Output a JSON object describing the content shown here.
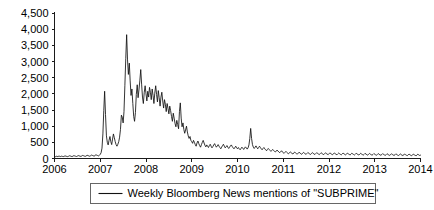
{
  "chart_data": {
    "type": "line",
    "title": "",
    "subtitle": "",
    "xlabel": "",
    "ylabel": "",
    "grid": false,
    "legend_position": "bottom-center",
    "xlim": [
      2006.0,
      2014.0
    ],
    "ylim": [
      0,
      4500
    ],
    "y_ticks": [
      0,
      500,
      1000,
      1500,
      2000,
      2500,
      3000,
      3500,
      4000,
      4500
    ],
    "y_tick_labels": [
      "0",
      "500",
      "1,000",
      "1,500",
      "2,000",
      "2,500",
      "3,000",
      "3,500",
      "4,000",
      "4,500"
    ],
    "x_ticks": [
      2006,
      2007,
      2008,
      2009,
      2010,
      2011,
      2012,
      2013,
      2014
    ],
    "x_tick_labels": [
      "2006",
      "2007",
      "2008",
      "2009",
      "2010",
      "2011",
      "2012",
      "2013",
      "2014"
    ],
    "series": [
      {
        "name": "Weekly Bloomberg News mentions of \"SUBPRIME\"",
        "color": "#111111",
        "x": [
          2006.0,
          2006.019,
          2006.038,
          2006.058,
          2006.077,
          2006.096,
          2006.115,
          2006.135,
          2006.154,
          2006.173,
          2006.192,
          2006.212,
          2006.231,
          2006.25,
          2006.269,
          2006.288,
          2006.308,
          2006.327,
          2006.346,
          2006.365,
          2006.385,
          2006.404,
          2006.423,
          2006.442,
          2006.462,
          2006.481,
          2006.5,
          2006.519,
          2006.538,
          2006.558,
          2006.577,
          2006.596,
          2006.615,
          2006.635,
          2006.654,
          2006.673,
          2006.692,
          2006.712,
          2006.731,
          2006.75,
          2006.769,
          2006.788,
          2006.808,
          2006.827,
          2006.846,
          2006.865,
          2006.885,
          2006.904,
          2006.923,
          2006.942,
          2006.962,
          2006.981,
          2007.0,
          2007.019,
          2007.038,
          2007.058,
          2007.077,
          2007.096,
          2007.115,
          2007.135,
          2007.154,
          2007.173,
          2007.192,
          2007.212,
          2007.231,
          2007.25,
          2007.269,
          2007.288,
          2007.308,
          2007.327,
          2007.346,
          2007.365,
          2007.385,
          2007.404,
          2007.423,
          2007.442,
          2007.462,
          2007.481,
          2007.5,
          2007.519,
          2007.538,
          2007.558,
          2007.577,
          2007.596,
          2007.615,
          2007.635,
          2007.654,
          2007.673,
          2007.692,
          2007.712,
          2007.731,
          2007.75,
          2007.769,
          2007.788,
          2007.808,
          2007.827,
          2007.846,
          2007.865,
          2007.885,
          2007.904,
          2007.923,
          2007.942,
          2007.962,
          2007.981,
          2008.0,
          2008.019,
          2008.038,
          2008.058,
          2008.077,
          2008.096,
          2008.115,
          2008.135,
          2008.154,
          2008.173,
          2008.192,
          2008.212,
          2008.231,
          2008.25,
          2008.269,
          2008.288,
          2008.308,
          2008.327,
          2008.346,
          2008.365,
          2008.385,
          2008.404,
          2008.423,
          2008.442,
          2008.462,
          2008.481,
          2008.5,
          2008.519,
          2008.538,
          2008.558,
          2008.577,
          2008.596,
          2008.615,
          2008.635,
          2008.654,
          2008.673,
          2008.692,
          2008.712,
          2008.731,
          2008.75,
          2008.769,
          2008.788,
          2008.808,
          2008.827,
          2008.846,
          2008.865,
          2008.885,
          2008.904,
          2008.923,
          2008.942,
          2008.962,
          2008.981,
          2009.0,
          2009.019,
          2009.038,
          2009.058,
          2009.077,
          2009.096,
          2009.115,
          2009.135,
          2009.154,
          2009.173,
          2009.192,
          2009.212,
          2009.231,
          2009.25,
          2009.269,
          2009.288,
          2009.308,
          2009.327,
          2009.346,
          2009.365,
          2009.385,
          2009.404,
          2009.423,
          2009.442,
          2009.462,
          2009.481,
          2009.5,
          2009.519,
          2009.538,
          2009.558,
          2009.577,
          2009.596,
          2009.615,
          2009.635,
          2009.654,
          2009.673,
          2009.692,
          2009.712,
          2009.731,
          2009.75,
          2009.769,
          2009.788,
          2009.808,
          2009.827,
          2009.846,
          2009.865,
          2009.885,
          2009.904,
          2009.923,
          2009.942,
          2009.962,
          2009.981,
          2010.0,
          2010.019,
          2010.038,
          2010.058,
          2010.077,
          2010.096,
          2010.115,
          2010.135,
          2010.154,
          2010.173,
          2010.192,
          2010.212,
          2010.231,
          2010.25,
          2010.269,
          2010.288,
          2010.308,
          2010.327,
          2010.346,
          2010.365,
          2010.385,
          2010.404,
          2010.423,
          2010.442,
          2010.462,
          2010.481,
          2010.5,
          2010.519,
          2010.538,
          2010.558,
          2010.577,
          2010.596,
          2010.615,
          2010.635,
          2010.654,
          2010.673,
          2010.692,
          2010.712,
          2010.731,
          2010.75,
          2010.769,
          2010.788,
          2010.808,
          2010.827,
          2010.846,
          2010.865,
          2010.885,
          2010.904,
          2010.923,
          2010.942,
          2010.962,
          2010.981,
          2011.0,
          2011.019,
          2011.038,
          2011.058,
          2011.077,
          2011.096,
          2011.115,
          2011.135,
          2011.154,
          2011.173,
          2011.192,
          2011.212,
          2011.231,
          2011.25,
          2011.269,
          2011.288,
          2011.308,
          2011.327,
          2011.346,
          2011.365,
          2011.385,
          2011.404,
          2011.423,
          2011.442,
          2011.462,
          2011.481,
          2011.5,
          2011.519,
          2011.538,
          2011.558,
          2011.577,
          2011.596,
          2011.615,
          2011.635,
          2011.654,
          2011.673,
          2011.692,
          2011.712,
          2011.731,
          2011.75,
          2011.769,
          2011.788,
          2011.808,
          2011.827,
          2011.846,
          2011.865,
          2011.885,
          2011.904,
          2011.923,
          2011.942,
          2011.962,
          2011.981,
          2012.0,
          2012.019,
          2012.038,
          2012.058,
          2012.077,
          2012.096,
          2012.115,
          2012.135,
          2012.154,
          2012.173,
          2012.192,
          2012.212,
          2012.231,
          2012.25,
          2012.269,
          2012.288,
          2012.308,
          2012.327,
          2012.346,
          2012.365,
          2012.385,
          2012.404,
          2012.423,
          2012.442,
          2012.462,
          2012.481,
          2012.5,
          2012.519,
          2012.538,
          2012.558,
          2012.577,
          2012.596,
          2012.615,
          2012.635,
          2012.654,
          2012.673,
          2012.692,
          2012.712,
          2012.731,
          2012.75,
          2012.769,
          2012.788,
          2012.808,
          2012.827,
          2012.846,
          2012.865,
          2012.885,
          2012.904,
          2012.923,
          2012.942,
          2012.962,
          2012.981,
          2013.0,
          2013.019,
          2013.038,
          2013.058,
          2013.077,
          2013.096,
          2013.115,
          2013.135,
          2013.154,
          2013.173,
          2013.192,
          2013.212,
          2013.231,
          2013.25,
          2013.269,
          2013.288,
          2013.308,
          2013.327,
          2013.346,
          2013.365,
          2013.385,
          2013.404,
          2013.423,
          2013.442,
          2013.462,
          2013.481,
          2013.5,
          2013.519,
          2013.538,
          2013.558,
          2013.577,
          2013.596,
          2013.615,
          2013.635,
          2013.654,
          2013.673,
          2013.692,
          2013.712,
          2013.731,
          2013.75,
          2013.769,
          2013.788,
          2013.808,
          2013.827,
          2013.846,
          2013.865,
          2013.885,
          2013.904,
          2013.923,
          2013.942,
          2013.962,
          2013.981,
          2014.0
        ],
        "values": [
          60,
          55,
          70,
          62,
          58,
          75,
          68,
          60,
          72,
          65,
          58,
          70,
          80,
          72,
          64,
          58,
          70,
          85,
          78,
          66,
          60,
          74,
          88,
          80,
          70,
          62,
          75,
          90,
          82,
          72,
          65,
          78,
          95,
          86,
          74,
          66,
          80,
          100,
          92,
          80,
          70,
          85,
          105,
          96,
          84,
          74,
          90,
          115,
          104,
          92,
          80,
          98,
          130,
          180,
          320,
          760,
          1480,
          2080,
          1360,
          700,
          500,
          420,
          560,
          680,
          520,
          430,
          600,
          760,
          640,
          520,
          430,
          380,
          440,
          520,
          660,
          900,
          1340,
          1280,
          1100,
          1450,
          2250,
          3100,
          3830,
          3050,
          2600,
          2950,
          2400,
          1950,
          2150,
          1700,
          1300,
          1150,
          1420,
          1980,
          2280,
          1880,
          2120,
          2400,
          2750,
          2300,
          1900,
          1700,
          2050,
          2250,
          2000,
          1780,
          2080,
          1900,
          2200,
          2050,
          1820,
          2150,
          1950,
          1700,
          2020,
          2250,
          1980,
          1750,
          2100,
          1880,
          1620,
          1900,
          2050,
          1780,
          1560,
          1820,
          1680,
          1450,
          1700,
          1550,
          1380,
          1620,
          1480,
          1300,
          1150,
          1400,
          1250,
          1080,
          980,
          1180,
          1050,
          920,
          1450,
          1720,
          1250,
          980,
          1100,
          900,
          780,
          880,
          1000,
          820,
          700,
          620,
          680,
          560,
          520,
          470,
          560,
          500,
          430,
          380,
          480,
          540,
          460,
          400,
          350,
          430,
          500,
          560,
          480,
          410,
          360,
          420,
          380,
          340,
          400,
          440,
          380,
          330,
          370,
          420,
          460,
          400,
          350,
          390,
          430,
          380,
          340,
          300,
          350,
          400,
          440,
          380,
          330,
          360,
          400,
          350,
          310,
          350,
          390,
          420,
          370,
          330,
          300,
          340,
          380,
          330,
          300,
          340,
          300,
          270,
          310,
          350,
          320,
          280,
          320,
          360,
          330,
          290,
          330,
          420,
          620,
          930,
          620,
          430,
          350,
          310,
          350,
          390,
          340,
          300,
          340,
          380,
          340,
          300,
          270,
          310,
          340,
          300,
          270,
          240,
          280,
          310,
          280,
          250,
          220,
          250,
          280,
          250,
          220,
          200,
          230,
          260,
          230,
          200,
          180,
          210,
          240,
          200,
          180,
          160,
          190,
          220,
          190,
          165,
          145,
          175,
          205,
          180,
          155,
          140,
          170,
          200,
          175,
          150,
          135,
          165,
          195,
          170,
          148,
          130,
          160,
          190,
          165,
          145,
          128,
          158,
          186,
          162,
          142,
          125,
          155,
          182,
          160,
          140,
          124,
          152,
          180,
          158,
          138,
          122,
          150,
          178,
          156,
          136,
          120,
          148,
          176,
          154,
          134,
          118,
          146,
          174,
          152,
          132,
          116,
          144,
          172,
          150,
          130,
          115,
          142,
          170,
          148,
          128,
          114,
          140,
          168,
          146,
          126,
          112,
          138,
          166,
          144,
          125,
          110,
          136,
          164,
          142,
          124,
          109,
          134,
          162,
          140,
          122,
          108,
          132,
          160,
          138,
          120,
          106,
          130,
          158,
          136,
          118,
          105,
          128,
          156,
          134,
          116,
          104,
          126,
          154,
          132,
          114,
          102,
          124,
          152,
          130,
          112,
          100,
          122,
          150,
          128,
          110,
          98,
          120,
          148,
          126,
          108,
          96,
          118,
          146,
          124,
          106,
          95,
          116,
          144,
          122,
          104,
          93,
          114,
          142,
          120,
          102,
          92,
          112,
          140,
          118,
          100,
          90,
          110,
          138,
          116,
          98,
          88,
          108,
          136,
          114,
          96,
          86,
          106,
          134,
          112,
          94,
          104
        ]
      }
    ]
  },
  "legend": {
    "entries": [
      {
        "label": "Weekly Bloomberg News mentions of \"SUBPRIME\"",
        "color": "#111111"
      }
    ]
  }
}
